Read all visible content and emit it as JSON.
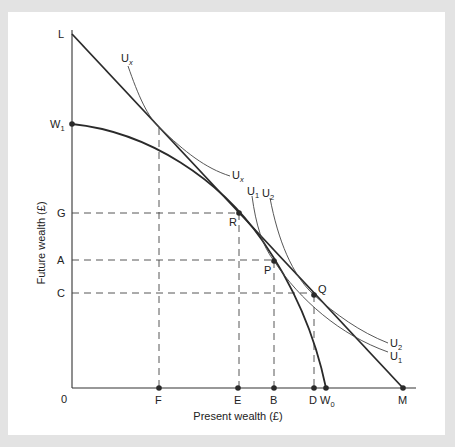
{
  "diagram": {
    "axes": {
      "x_label": "Present wealth (£)",
      "y_label": "Future wealth (£)",
      "origin_label": "0"
    },
    "y_ticks": [
      {
        "label": "L",
        "y": 34
      },
      {
        "label": "W",
        "sub": "1",
        "y": 124
      },
      {
        "label": "G",
        "y": 213
      },
      {
        "label": "A",
        "y": 260
      },
      {
        "label": "C",
        "y": 293
      }
    ],
    "x_ticks": [
      {
        "label": "F",
        "x": 159
      },
      {
        "label": "E",
        "x": 238
      },
      {
        "label": "B",
        "x": 274
      },
      {
        "label": "D",
        "x": 314
      },
      {
        "label": "W",
        "sub": "0",
        "x": 326
      },
      {
        "label": "M",
        "x": 403
      }
    ],
    "points": [
      {
        "label": "R",
        "x": 239,
        "y": 213
      },
      {
        "label": "P",
        "x": 274,
        "y": 261
      },
      {
        "label": "Q",
        "x": 314,
        "y": 295
      }
    ],
    "curves": {
      "market_line": {
        "from": "L",
        "to": "M"
      },
      "production_frontier": {
        "from": "W1",
        "to": "W0"
      },
      "indifference": [
        {
          "label": "U",
          "sub": "x"
        },
        {
          "label": "U",
          "sub": "1"
        },
        {
          "label": "U",
          "sub": "2"
        }
      ]
    },
    "labels": {
      "L": "L",
      "W1": "W",
      "W1_sub": "1",
      "G": "G",
      "A": "A",
      "C": "C",
      "zero": "0",
      "F": "F",
      "E": "E",
      "B": "B",
      "D": "D",
      "W0": "W",
      "W0_sub": "0",
      "M": "M",
      "R": "R",
      "P": "P",
      "Q": "Q",
      "Ux_top": "U",
      "Ux_top_sub": "x",
      "Ux_mid": "U",
      "Ux_mid_sub": "x",
      "U1_top": "U",
      "U1_top_sub": "1",
      "U2_top": "U",
      "U2_top_sub": "2",
      "U2_right": "U",
      "U2_right_sub": "2",
      "U1_right": "U",
      "U1_right_sub": "1"
    }
  }
}
